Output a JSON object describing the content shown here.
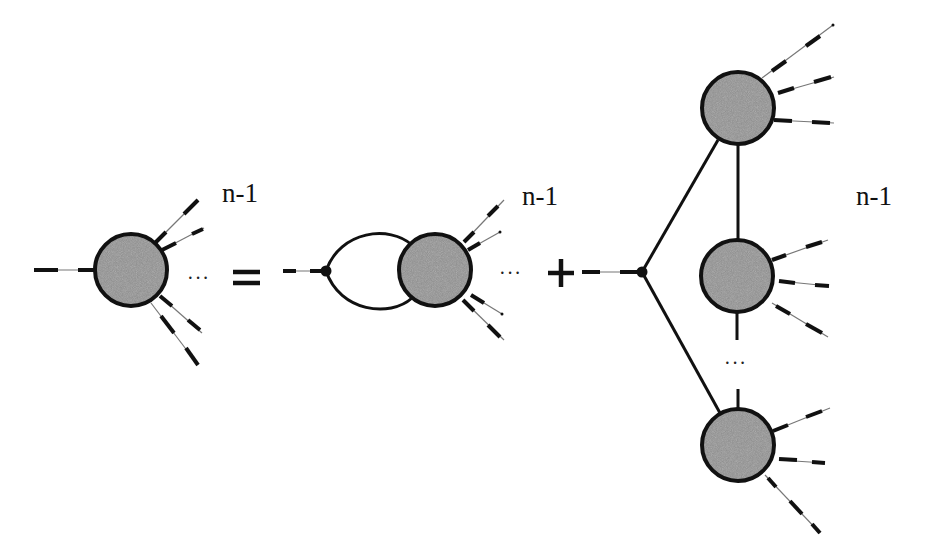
{
  "diagram": {
    "labels": {
      "lhs_legs": "n-1",
      "rhs1_legs": "n-1",
      "rhs2_legs": "n-1",
      "lhs_dots": "···",
      "rhs1_dots": "···",
      "rhs2_vertical_dots": "···"
    },
    "operators": {
      "equals": "=",
      "plus": "+"
    },
    "colors": {
      "blob_fill": "#8c8c8c",
      "stroke": "#111111",
      "background": "#ffffff"
    },
    "nodes": [
      {
        "id": "lhs-blob",
        "type": "blob",
        "cx": 131,
        "cy": 270,
        "r": 36
      },
      {
        "id": "rhs1-vertex",
        "type": "vertex",
        "cx": 326,
        "cy": 271
      },
      {
        "id": "rhs1-blob",
        "type": "blob",
        "cx": 435,
        "cy": 270,
        "r": 36
      },
      {
        "id": "rhs2-vertex",
        "type": "vertex",
        "cx": 642,
        "cy": 272
      },
      {
        "id": "rhs2-blob-top",
        "type": "blob",
        "cx": 738,
        "cy": 108,
        "r": 36
      },
      {
        "id": "rhs2-blob-middle",
        "type": "blob",
        "cx": 737,
        "cy": 276,
        "r": 36
      },
      {
        "id": "rhs2-blob-bottom",
        "type": "blob",
        "cx": 738,
        "cy": 445,
        "r": 36
      }
    ]
  }
}
